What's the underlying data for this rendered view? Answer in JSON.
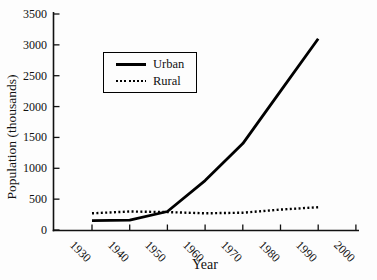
{
  "figure": {
    "width": 377,
    "height": 280,
    "background": "#fdfdfd",
    "axis_color": "#111111",
    "line_color": "#000000",
    "text_color": "#111111"
  },
  "chart_data": {
    "type": "line",
    "title": "",
    "xlabel": "Year",
    "ylabel": "Population (thousands)",
    "x": [
      1930,
      1940,
      1950,
      1960,
      1970,
      1980,
      1990
    ],
    "series": [
      {
        "name": "Urban",
        "line_style": "solid",
        "color": "#000000",
        "values": [
          150,
          160,
          300,
          800,
          1400,
          2250,
          3100
        ]
      },
      {
        "name": "Rural",
        "line_style": "dotted",
        "color": "#000000",
        "values": [
          270,
          300,
          290,
          270,
          280,
          330,
          370
        ]
      }
    ],
    "x_ticks": [
      1930,
      1940,
      1950,
      1960,
      1970,
      1980,
      1990,
      2000
    ],
    "y_ticks": [
      0,
      500,
      1000,
      1500,
      2000,
      2500,
      3000,
      3500
    ],
    "xlim": [
      1919.5,
      2000.8
    ],
    "ylim": [
      0,
      3500
    ],
    "grid": false,
    "legend_position": "upper-left-inside"
  }
}
